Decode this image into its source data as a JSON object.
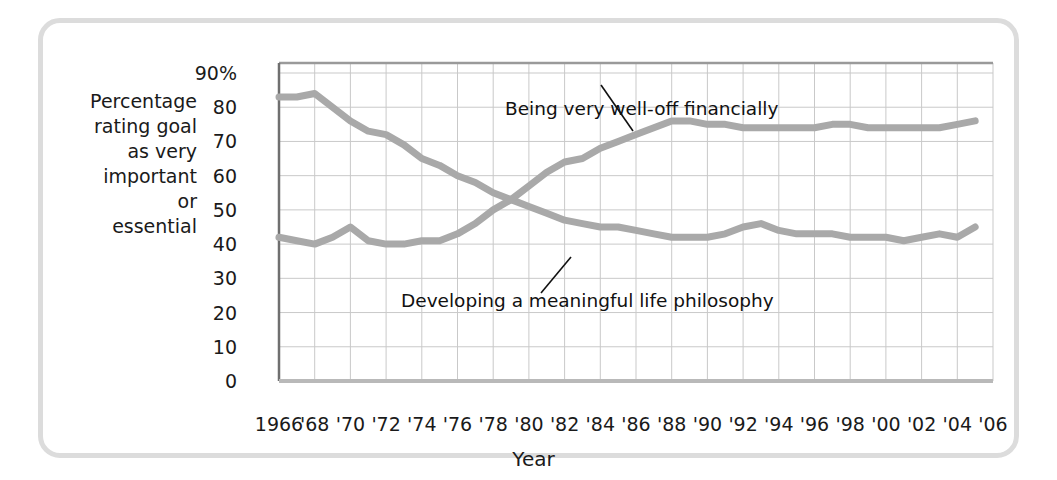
{
  "figure": {
    "y_axis_caption_lines": [
      "Percentage",
      "rating goal",
      "as very",
      "important",
      "or",
      "essential"
    ],
    "x_axis_title": "Year"
  },
  "chart_data": {
    "type": "line",
    "title": "",
    "subtitle": "",
    "xlabel": "Year",
    "ylabel": "Percentage rating goal as very important or essential",
    "xlim": [
      1966,
      2006
    ],
    "ylim": [
      0,
      90
    ],
    "grid": true,
    "legend_position": "inline-annotations",
    "y_ticks": [
      0,
      10,
      20,
      30,
      40,
      50,
      60,
      70,
      80,
      90
    ],
    "y_tick_labels": [
      "0",
      "10",
      "20",
      "30",
      "40",
      "50",
      "60",
      "70",
      "80",
      "90%"
    ],
    "x_ticks": [
      1966,
      1968,
      1970,
      1972,
      1974,
      1976,
      1978,
      1980,
      1982,
      1984,
      1986,
      1988,
      1990,
      1992,
      1994,
      1996,
      1998,
      2000,
      2002,
      2004,
      2006
    ],
    "x_tick_labels": [
      "1966",
      "'68",
      "'70",
      "'72",
      "'74",
      "'76",
      "'78",
      "'80",
      "'82",
      "'84",
      "'86",
      "'88",
      "'90",
      "'92",
      "'94",
      "'96",
      "'98",
      "'00",
      "'02",
      "'04",
      "'06"
    ],
    "line_color": "#a9a9a9",
    "grid_color": "#c9c9c9",
    "axis_color": "#8f8f8f",
    "x": [
      1966,
      1967,
      1968,
      1969,
      1970,
      1971,
      1972,
      1973,
      1974,
      1975,
      1976,
      1977,
      1978,
      1979,
      1980,
      1981,
      1982,
      1983,
      1984,
      1985,
      1986,
      1987,
      1988,
      1989,
      1990,
      1991,
      1992,
      1993,
      1994,
      1995,
      1996,
      1997,
      1998,
      1999,
      2000,
      2001,
      2002,
      2003,
      2004,
      2005
    ],
    "series": [
      {
        "name": "Developing a meaningful life philosophy",
        "annotation": "Developing a meaningful life philosophy",
        "values": [
          83,
          83,
          84,
          80,
          76,
          73,
          72,
          69,
          65,
          63,
          60,
          58,
          55,
          53,
          51,
          49,
          47,
          46,
          45,
          45,
          44,
          43,
          42,
          42,
          42,
          43,
          45,
          46,
          44,
          43,
          43,
          43,
          42,
          42,
          42,
          41,
          42,
          43,
          42,
          45
        ]
      },
      {
        "name": "Being very well-off financially",
        "annotation": "Being very well-off financially",
        "values": [
          42,
          41,
          40,
          42,
          45,
          41,
          40,
          40,
          41,
          41,
          43,
          46,
          50,
          53,
          57,
          61,
          64,
          65,
          68,
          70,
          72,
          74,
          76,
          76,
          75,
          75,
          74,
          74,
          74,
          74,
          74,
          75,
          75,
          74,
          74,
          74,
          74,
          74,
          75,
          76
        ]
      }
    ]
  }
}
